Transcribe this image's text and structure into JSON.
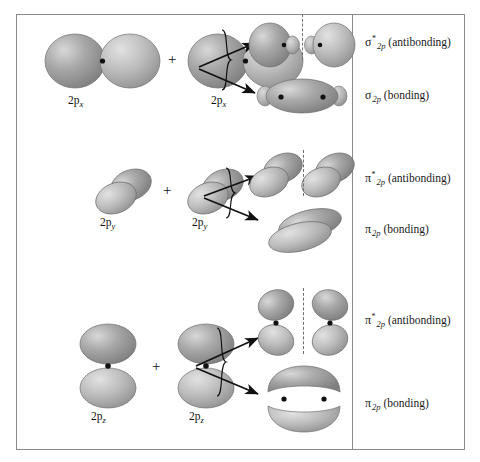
{
  "figure": {
    "border_color": "#8a8a8a",
    "background": "#ffffff",
    "orbital_fill_dark": "#8e8e8e",
    "orbital_fill_light": "#c9c9c9",
    "nucleus_color": "#111111",
    "divider_x": 352
  },
  "symbols": {
    "plus": "+",
    "sigma": "σ",
    "pi": "π",
    "star": "*",
    "subscript_2p": "2p"
  },
  "rows": [
    {
      "id": "row-2px",
      "atomic_orbital_label": "2p",
      "atomic_orbital_axis": "x",
      "orientation": "horizontal",
      "products": [
        {
          "id": "sigma-antibonding",
          "symbol": "σ",
          "star": "*",
          "sub": "2p",
          "suffix": "(antibonding)",
          "full": "σ*2p (antibonding)",
          "has_nodal_plane": true
        },
        {
          "id": "sigma-bonding",
          "symbol": "σ",
          "star": "",
          "sub": "2p",
          "suffix": "(bonding)",
          "full": "σ2p (bonding)",
          "has_nodal_plane": false
        }
      ]
    },
    {
      "id": "row-2py",
      "atomic_orbital_label": "2p",
      "atomic_orbital_axis": "y",
      "orientation": "tilted",
      "products": [
        {
          "id": "pi-y-antibonding",
          "symbol": "π",
          "star": "*",
          "sub": "2p",
          "suffix": "(antibonding)",
          "full": "π*2p (antibonding)",
          "has_nodal_plane": true
        },
        {
          "id": "pi-y-bonding",
          "symbol": "π",
          "star": "",
          "sub": "2p",
          "suffix": "(bonding)",
          "full": "π2p (bonding)",
          "has_nodal_plane": false
        }
      ]
    },
    {
      "id": "row-2pz",
      "atomic_orbital_label": "2p",
      "atomic_orbital_axis": "z",
      "orientation": "vertical",
      "products": [
        {
          "id": "pi-z-antibonding",
          "symbol": "π",
          "star": "*",
          "sub": "2p",
          "suffix": "(antibonding)",
          "full": "π*2p (antibonding)",
          "has_nodal_plane": true
        },
        {
          "id": "pi-z-bonding",
          "symbol": "π",
          "star": "",
          "sub": "2p",
          "suffix": "(bonding)",
          "full": "π2p (bonding)",
          "has_nodal_plane": false
        }
      ]
    }
  ],
  "labels": {
    "r1_ao_left": "2p",
    "r1_ao_left_ax": "x",
    "r1_ao_right": "2p",
    "r1_ao_right_ax": "x",
    "r2_ao_left": "2p",
    "r2_ao_left_ax": "y",
    "r2_ao_right": "2p",
    "r2_ao_right_ax": "y",
    "r3_ao_left": "2p",
    "r3_ao_left_ax": "z",
    "r3_ao_right": "2p",
    "r3_ao_right_ax": "z",
    "r1_anti_suffix": "(antibonding)",
    "r1_bond_suffix": "(bonding)",
    "r2_anti_suffix": "(antibonding)",
    "r2_bond_suffix": "(bonding)",
    "r3_anti_suffix": "(antibonding)",
    "r3_bond_suffix": "(bonding)"
  }
}
